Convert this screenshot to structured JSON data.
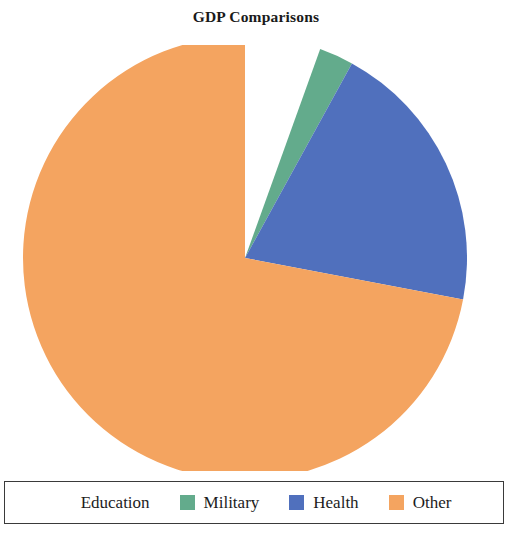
{
  "chart_data": {
    "type": "pie",
    "title": "GDP Comparisons",
    "labels": [
      "Education",
      "Military",
      "Health",
      "Other"
    ],
    "values": [
      5.5,
      2.5,
      20.0,
      72.0
    ],
    "colors": [
      "#ffffff",
      "#63ab8c",
      "#5070bd",
      "#f4a460"
    ],
    "units": "percent",
    "start_angle_deg": 90,
    "direction": "clockwise",
    "legend_position": "bottom",
    "grid": false,
    "xlabel": "",
    "ylabel": ""
  },
  "figure": {
    "title": "GDP Comparisons",
    "background": "#ffffff"
  },
  "legend": {
    "border_color": "#3a3a3a",
    "entries": [
      {
        "label": "Education",
        "color": "#ffffff"
      },
      {
        "label": "Military",
        "color": "#63ab8c"
      },
      {
        "label": "Health",
        "color": "#5070bd"
      },
      {
        "label": "Other",
        "color": "#f4a460"
      }
    ]
  }
}
